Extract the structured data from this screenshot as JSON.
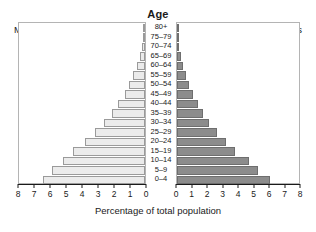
{
  "chart_data": {
    "type": "bar",
    "title": "Age",
    "subtitle": "",
    "xlabel": "Percentage of total population",
    "ylabel": "Age",
    "orientation": "horizontal",
    "layout": "population-pyramid",
    "grid": false,
    "legend_position": "inline-corners",
    "left_panel_label": "Males",
    "right_panel_label": "Females",
    "left_axis_ticks": [
      8,
      7,
      6,
      5,
      4,
      3,
      2,
      1,
      0
    ],
    "right_axis_ticks": [
      0,
      1,
      2,
      3,
      4,
      5,
      6,
      7,
      8
    ],
    "left_xlim": [
      8,
      0
    ],
    "right_xlim": [
      0,
      8
    ],
    "axis_max": 8,
    "categories": [
      "0–4",
      "5–9",
      "10–14",
      "15–19",
      "20–24",
      "25–29",
      "30–34",
      "35–39",
      "40–44",
      "45–49",
      "50–54",
      "55–59",
      "60–64",
      "65–69",
      "70–74",
      "75–79",
      "80+"
    ],
    "series": [
      {
        "name": "Males",
        "side": "left",
        "color": "#ebebeb",
        "values": [
          6.5,
          5.9,
          5.2,
          4.6,
          3.8,
          3.2,
          2.6,
          2.1,
          1.7,
          1.3,
          1.0,
          0.75,
          0.5,
          0.3,
          0.18,
          0.1,
          0.05
        ]
      },
      {
        "name": "Females",
        "side": "right",
        "color": "#8c8c8c",
        "values": [
          6.1,
          5.3,
          4.7,
          3.8,
          3.2,
          2.6,
          2.1,
          1.7,
          1.35,
          1.05,
          0.8,
          0.6,
          0.4,
          0.25,
          0.15,
          0.08,
          0.04
        ]
      }
    ]
  },
  "colors": {
    "males_fill": "#ebebeb",
    "males_stroke": "#9a9a9a",
    "females_fill": "#8c8c8c",
    "females_stroke": "#6e6e6e",
    "panel_border": "#b4b4b4",
    "axis": "#1a1a1a",
    "background": "#ffffff"
  }
}
